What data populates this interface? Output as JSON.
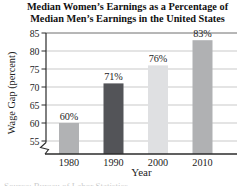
{
  "title": {
    "line1": "Median Women’s Earnings as a Percentage of",
    "line2": "Median Men’s Earnings in the United States"
  },
  "chart_data": {
    "type": "bar",
    "title": "Median Women’s Earnings as a Percentage of Median Men’s Earnings in the United States",
    "categories": [
      "1980",
      "1990",
      "2000",
      "2010"
    ],
    "values": [
      60,
      71,
      76,
      83
    ],
    "bar_labels": [
      "60%",
      "71%",
      "76%",
      "83%"
    ],
    "bar_colors": [
      "#b1b2b4",
      "#535458",
      "#dfe0e2",
      "#b0b1b3"
    ],
    "xlabel": "Year",
    "ylabel": "Wage Gap (percent)",
    "yticks": [
      55,
      60,
      65,
      70,
      75,
      80,
      85
    ],
    "ylim": [
      55,
      85
    ],
    "axis_break_below_min": true,
    "grid": "horizontal",
    "gridline_color": "#c9c9c9",
    "frame_line_color": "#6e6e6e",
    "axis_color": "#2b2b2b",
    "legend": "none"
  },
  "source_line": "Source: Bureau of Labor Statistics"
}
